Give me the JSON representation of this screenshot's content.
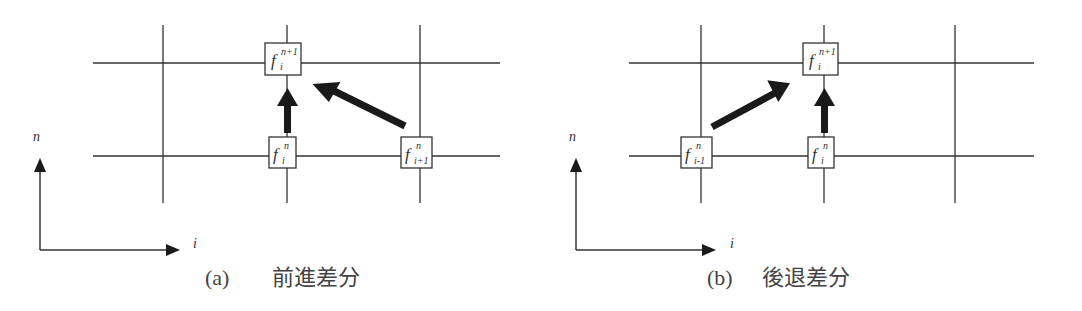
{
  "panels": [
    {
      "id": "a",
      "caption_label": "(a)",
      "caption_text": "前進差分",
      "axis_vertical_label": "n",
      "axis_horizontal_label": "i",
      "nodes": [
        {
          "name": "f",
          "sup": "n+1",
          "sub": "i"
        },
        {
          "name": "f",
          "sup": "n",
          "sub": "i"
        },
        {
          "name": "f",
          "sup": "n",
          "sub": "i+1"
        }
      ]
    },
    {
      "id": "b",
      "caption_label": "(b)",
      "caption_text": "後退差分",
      "axis_vertical_label": "n",
      "axis_horizontal_label": "i",
      "nodes": [
        {
          "name": "f",
          "sup": "n+1",
          "sub": "i"
        },
        {
          "name": "f",
          "sup": "n",
          "sub": "i-1"
        },
        {
          "name": "f",
          "sup": "n",
          "sub": "i"
        }
      ]
    }
  ],
  "colors": {
    "line": "#333333",
    "arrow": "#1a1a1a",
    "background": "#ffffff"
  }
}
